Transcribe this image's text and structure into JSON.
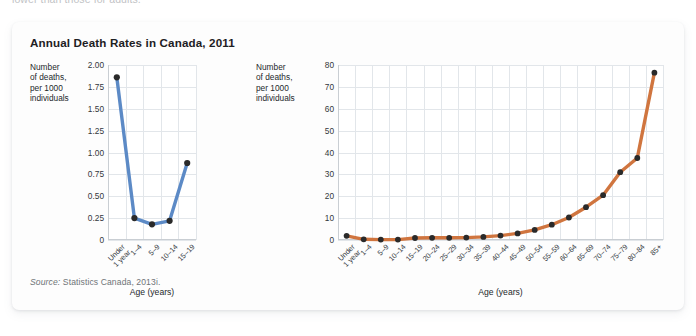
{
  "page_bleed_text": "lower than those for adults.",
  "figure": {
    "title": "Annual Death Rates in Canada, 2011",
    "source_label": "Source:",
    "source_text": " Statistics Canada, 2013i."
  },
  "colors": {
    "series_child": "#5C8AC6",
    "series_all": "#D0753F",
    "marker": "#2a2a2a",
    "grid": "#e2e6ea",
    "axis": "#c9ced3",
    "card_background": "#fdfdfd",
    "page_background": "#ffffff",
    "title_text": "#1d2023",
    "source_text": "#6f7478"
  },
  "chart_data": [
    {
      "type": "line",
      "id": "children-death-rates",
      "title": "Annual Death Rates in Canada, 2011",
      "ylabel": "Number\nof deaths,\nper 1000\nindividuals",
      "xlabel": "Age (years)",
      "categories": [
        "Under\n1 year",
        "1–4",
        "5–9",
        "10–14",
        "15–19"
      ],
      "values": [
        1.86,
        0.25,
        0.18,
        0.22,
        0.88
      ],
      "ylim": [
        0,
        2.0
      ],
      "yticks": [
        "0",
        "0.25",
        "0.50",
        "0.75",
        "1.00",
        "1.25",
        "1.50",
        "1.75",
        "2.00"
      ],
      "ytick_values": [
        0,
        0.25,
        0.5,
        0.75,
        1.0,
        1.25,
        1.5,
        1.75,
        2.0
      ],
      "grid": true,
      "legend": "none",
      "series_color": "#5C8AC6"
    },
    {
      "type": "line",
      "id": "all-ages-death-rates",
      "title": "Annual Death Rates in Canada, 2011",
      "ylabel": "Number\nof deaths,\nper 1000\nindividuals",
      "xlabel": "Age (years)",
      "categories": [
        "Under\n1 year",
        "1–4",
        "5–9",
        "10–14",
        "15–19",
        "20–24",
        "25–29",
        "30–34",
        "35–39",
        "40–44",
        "45–49",
        "50–54",
        "55–59",
        "60–64",
        "65–69",
        "70–74",
        "75–79",
        "80–84",
        "85+"
      ],
      "values": [
        1.9,
        0.3,
        0.2,
        0.2,
        0.9,
        1.0,
        1.0,
        1.1,
        1.4,
        2.0,
        3.0,
        4.6,
        7.0,
        10.3,
        15.0,
        20.5,
        31.0,
        37.5,
        76.5
      ],
      "ylim": [
        0,
        80
      ],
      "yticks": [
        "0",
        "10",
        "20",
        "30",
        "40",
        "50",
        "60",
        "70",
        "80"
      ],
      "ytick_values": [
        0,
        10,
        20,
        30,
        40,
        50,
        60,
        70,
        80
      ],
      "grid": true,
      "legend": "none",
      "series_color": "#D0753F"
    }
  ]
}
